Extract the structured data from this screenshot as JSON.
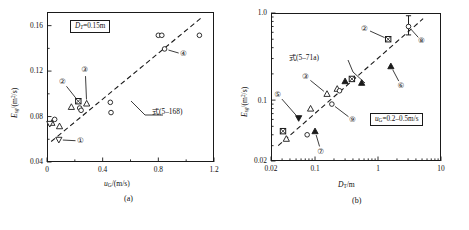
{
  "figure": {
    "panel_a_caption": "(a)",
    "panel_b_caption": "(b)"
  },
  "panel_a": {
    "info_box": "D_T=0.15m",
    "info_box_parts": {
      "var": "D",
      "sub": "T",
      "rest": "=0.15m"
    },
    "equation_label_cjk": "式",
    "equation_label_num": "(5–168)",
    "x_axis": {
      "title_var": "u",
      "title_sub": "G",
      "title_rest": "/(m/s)",
      "ticks": [
        "0",
        "0.4",
        "0.8",
        "1.2"
      ]
    },
    "y_axis": {
      "title_var": "E",
      "title_sub": "sg",
      "title_rest": "/(m",
      "title_sup": "2",
      "title_tail": "/s)",
      "ticks": [
        "0.04",
        "0.08",
        "0.12",
        "0.16"
      ]
    },
    "callouts": [
      "①",
      "②",
      "③",
      "④"
    ]
  },
  "panel_b": {
    "info_box": "u_G=0.2–0.5m/s",
    "info_box_parts": {
      "var": "u",
      "sub": "G",
      "rest": "=0.2–0.5m/s"
    },
    "equation_label_cjk": "式",
    "equation_label_num": "(5–71a)",
    "x_axis": {
      "title_var": "D",
      "title_sub": "T",
      "title_rest": "/m",
      "ticks": [
        "0.02",
        "0.1",
        "1",
        "10"
      ]
    },
    "y_axis": {
      "title_var": "E",
      "title_sub": "sg",
      "title_rest": "/(m",
      "title_sup": "2",
      "title_tail": "/s)",
      "ticks": [
        "0.02",
        "0.1",
        "1.0"
      ]
    },
    "callouts": [
      "②",
      "③",
      "⑤",
      "⑥",
      "⑦",
      "⑧",
      "⑨"
    ]
  },
  "chart_data": [
    {
      "type": "scatter",
      "id": "panel-a",
      "title": "",
      "xlabel": "u_G/(m/s)",
      "ylabel": "E_sg/(m^2/s)",
      "xscale": "linear",
      "yscale": "linear",
      "xlim": [
        0,
        1.2
      ],
      "ylim": [
        0.04,
        0.172
      ],
      "xticks": [
        0,
        0.4,
        0.8,
        1.2
      ],
      "yticks": [
        0.04,
        0.08,
        0.12,
        0.16
      ],
      "grid": false,
      "legend": "none",
      "annotations": [
        {
          "text": "D_T=0.15m",
          "type": "boxed-label",
          "x": 0.2,
          "y": 0.163
        },
        {
          "text": "式 (5–168)",
          "type": "line-callout",
          "x": 0.72,
          "y": 0.105
        }
      ],
      "trend_line": {
        "style": "dashed",
        "x": [
          0.03,
          1.12
        ],
        "y": [
          0.058,
          0.168
        ]
      },
      "series": [
        {
          "name": "circle-open",
          "marker": "circle-open",
          "points": [
            [
              0.055,
              0.0775
            ],
            [
              0.235,
              0.0875
            ],
            [
              0.245,
              0.0855
            ],
            [
              0.455,
              0.0925
            ],
            [
              0.46,
              0.0835
            ],
            [
              0.8,
              0.1515
            ],
            [
              0.825,
              0.1515
            ],
            [
              0.845,
              0.1395
            ],
            [
              1.095,
              0.1515
            ]
          ]
        },
        {
          "name": "triangle-open",
          "marker": "triangle-up-open",
          "points": [
            [
              0.035,
              0.0745
            ],
            [
              0.09,
              0.0715
            ],
            [
              0.175,
              0.0885
            ],
            [
              0.285,
              0.0915
            ]
          ]
        },
        {
          "name": "triangle-down-open",
          "marker": "triangle-down-open",
          "points": [
            [
              0.02,
              0.0735
            ],
            [
              0.085,
              0.0595
            ]
          ]
        },
        {
          "name": "square-crossed",
          "marker": "square-crossed",
          "points": [
            [
              0.225,
              0.0935
            ]
          ]
        }
      ],
      "callout_markers": [
        {
          "label": "①",
          "target": [
            0.085,
            0.0595
          ],
          "label_pos": [
            0.245,
            0.0585
          ]
        },
        {
          "label": "②",
          "target": [
            0.225,
            0.0935
          ],
          "label_pos": [
            0.115,
            0.1105
          ]
        },
        {
          "label": "③",
          "target": [
            0.285,
            0.0915
          ],
          "label_pos": [
            0.275,
            0.1205
          ]
        },
        {
          "label": "④",
          "target": [
            0.845,
            0.1395
          ],
          "label_pos": [
            0.985,
            0.1345
          ]
        }
      ]
    },
    {
      "type": "scatter",
      "id": "panel-b",
      "title": "",
      "xlabel": "D_T/m",
      "ylabel": "E_sg/(m^2/s)",
      "xscale": "log",
      "yscale": "log",
      "xlim": [
        0.02,
        10
      ],
      "ylim": [
        0.02,
        1.0
      ],
      "xticks": [
        0.02,
        0.1,
        1,
        10
      ],
      "yticks": [
        0.02,
        0.1,
        1.0
      ],
      "grid": false,
      "legend": "none",
      "annotations": [
        {
          "text": "u_G=0.2–0.5m/s",
          "type": "boxed-label",
          "x": 2.2,
          "y": 0.031
        },
        {
          "text": "式 (5–71a)",
          "type": "line-callout",
          "x": 0.16,
          "y": 0.33
        }
      ],
      "trend_line": {
        "style": "dashed",
        "x": [
          0.026,
          5.2
        ],
        "y": [
          0.03,
          0.86
        ]
      },
      "error_bars": [
        {
          "x": 3.05,
          "y": 0.7,
          "ylow": 0.56,
          "yhigh": 0.93
        }
      ],
      "series": [
        {
          "name": "triangle-filled",
          "marker": "triangle-up-filled",
          "points": [
            [
              0.1,
              0.044
            ],
            [
              0.3,
              0.165
            ],
            [
              0.55,
              0.158
            ],
            [
              1.6,
              0.245
            ]
          ]
        },
        {
          "name": "triangle-open",
          "marker": "triangle-up-open",
          "points": [
            [
              0.035,
              0.036
            ],
            [
              0.085,
              0.08
            ],
            [
              0.155,
              0.118
            ],
            [
              0.225,
              0.135
            ]
          ]
        },
        {
          "name": "triangle-down-filled",
          "marker": "triangle-down-filled",
          "points": [
            [
              0.055,
              0.062
            ]
          ]
        },
        {
          "name": "square-crossed",
          "marker": "square-crossed",
          "points": [
            [
              0.031,
              0.044
            ],
            [
              0.385,
              0.175
            ],
            [
              1.45,
              0.5
            ]
          ]
        },
        {
          "name": "circle-open",
          "marker": "circle-open",
          "points": [
            [
              0.075,
              0.04
            ],
            [
              0.185,
              0.09
            ],
            [
              0.245,
              0.128
            ],
            [
              3.05,
              0.7
            ]
          ]
        }
      ],
      "callout_markers": [
        {
          "label": "②",
          "target": [
            1.45,
            0.5
          ],
          "label_pos": [
            0.62,
            0.66
          ]
        },
        {
          "label": "③",
          "target": [
            0.155,
            0.118
          ],
          "label_pos": [
            0.072,
            0.185
          ]
        },
        {
          "label": "⑤",
          "target": [
            0.055,
            0.062
          ],
          "label_pos": [
            0.026,
            0.115
          ]
        },
        {
          "label": "⑥",
          "target": [
            1.6,
            0.245
          ],
          "label_pos": [
            2.35,
            0.145
          ]
        },
        {
          "label": "⑦",
          "target": [
            0.1,
            0.044
          ],
          "label_pos": [
            0.125,
            0.0255
          ]
        },
        {
          "label": "⑧",
          "target": [
            3.05,
            0.7
          ],
          "label_pos": [
            5.0,
            0.47
          ]
        },
        {
          "label": "⑨",
          "target": [
            0.185,
            0.09
          ],
          "label_pos": [
            0.4,
            0.059
          ]
        }
      ]
    }
  ]
}
